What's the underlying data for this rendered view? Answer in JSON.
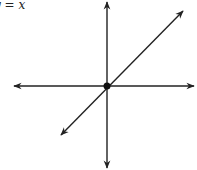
{
  "diagram": {
    "label": "y = x",
    "label_position": {
      "x": -6,
      "y": -2
    },
    "origin": {
      "x": 107,
      "y": 86
    },
    "x_axis": {
      "x1": 14,
      "x2": 194,
      "y": 86
    },
    "y_axis": {
      "x": 107,
      "y1": 1,
      "y2": 168
    },
    "line": {
      "x1": 61,
      "y1": 135,
      "x2": 183,
      "y2": 11
    },
    "colors": {
      "stroke": "#222222",
      "background": "#ffffff"
    }
  }
}
